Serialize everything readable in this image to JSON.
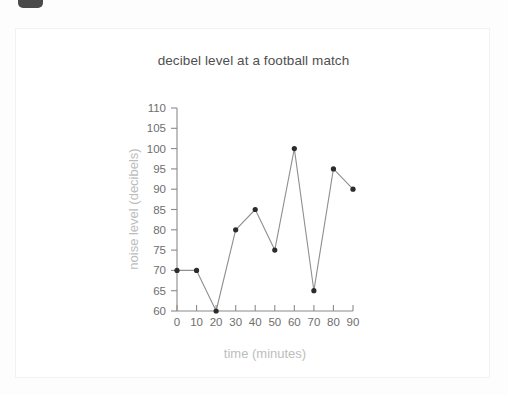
{
  "document": {
    "tab_badge": "dark-tab-badge",
    "card": "scanned-worksheet-card"
  },
  "chart_data": {
    "type": "line",
    "title": "decibel level at a football match",
    "xlabel": "time (minutes)",
    "ylabel": "noise level (decibels)",
    "x": [
      0,
      10,
      20,
      30,
      40,
      50,
      60,
      70,
      80,
      90
    ],
    "values": [
      70,
      70,
      60,
      80,
      85,
      75,
      100,
      65,
      95,
      90
    ],
    "xlim": [
      0,
      90
    ],
    "ylim": [
      60,
      110
    ],
    "xticks": [
      "0",
      "10",
      "20",
      "30",
      "40",
      "50",
      "60",
      "70",
      "80",
      "90"
    ],
    "yticks": [
      "60",
      "65",
      "70",
      "75",
      "80",
      "85",
      "90",
      "95",
      "100",
      "105",
      "110"
    ],
    "grid": false,
    "legend": null,
    "marker": "round-dot",
    "line_color": "#8f8f8f",
    "marker_color": "#2b2b2b",
    "tick_label_color": "#6e6e6e",
    "axis_title_color": "#bdbdbd",
    "title_color": "#4f4f4f"
  }
}
